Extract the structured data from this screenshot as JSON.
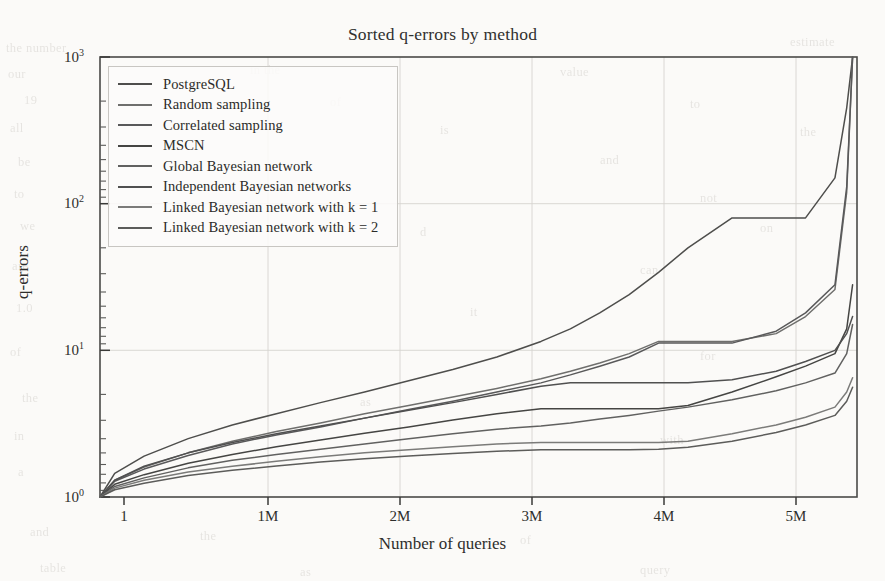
{
  "figure": {
    "title": "Sorted q-errors by method",
    "title_plain": "Sorted q-errors by method"
  },
  "axes": {
    "x_title": "Number of queries",
    "y_title": "q-errors",
    "x_ticks": [
      "1",
      "1M",
      "2M",
      "3M",
      "4M",
      "5M"
    ],
    "y_ticks": [
      "10",
      "10",
      "10",
      "10"
    ],
    "y_tick_exponents": [
      "0",
      "1",
      "2",
      "3"
    ]
  },
  "legend": {
    "items": [
      {
        "label": "PostgreSQL",
        "color": "#4e4e4c"
      },
      {
        "label": "Random sampling",
        "color": "#6f6f6d"
      },
      {
        "label": "Correlated sampling",
        "color": "#59595a"
      },
      {
        "label": "MSCN",
        "color": "#454543"
      },
      {
        "label": "Global Bayesian network",
        "color": "#616160"
      },
      {
        "label": "Independent Bayesian networks",
        "color": "#505050"
      },
      {
        "label": "Linked Bayesian network with k = 1",
        "color": "#7b7b79"
      },
      {
        "label": "Linked Bayesian network with k = 2",
        "color": "#5c5c5a"
      }
    ]
  },
  "chart_data": {
    "type": "line",
    "title": "Sorted q-errors by method",
    "xlabel": "Number of queries",
    "ylabel": "q-errors",
    "xlim": [
      0,
      5150000
    ],
    "ylim": [
      1,
      1000
    ],
    "yscale": "log",
    "xscale": "linear",
    "grid": true,
    "legend_position": "upper-left",
    "x_tick_values": [
      1,
      1000000,
      2000000,
      3000000,
      4000000,
      5000000
    ],
    "x_tick_labels": [
      "1",
      "1M",
      "2M",
      "3M",
      "4M",
      "5M"
    ],
    "y_tick_values": [
      1,
      10,
      100,
      1000
    ],
    "y_tick_labels": [
      "10^0",
      "10^1",
      "10^2",
      "10^3"
    ],
    "x": [
      1,
      100000,
      300000,
      600000,
      900000,
      1200000,
      1500000,
      1800000,
      2100000,
      2400000,
      2700000,
      3000000,
      3200000,
      3400000,
      3600000,
      3800000,
      4000000,
      4300000,
      4600000,
      4800000,
      5000000,
      5080000,
      5120000
    ],
    "series": [
      {
        "name": "PostgreSQL",
        "color": "#4e4e4c",
        "values": [
          1.0,
          1.45,
          1.9,
          2.5,
          3.1,
          3.7,
          4.4,
          5.2,
          6.2,
          7.4,
          9.0,
          11.5,
          14.0,
          18.0,
          24.0,
          34.0,
          50.0,
          80.0,
          80.0,
          80.0,
          150.0,
          450.0,
          1000.0
        ]
      },
      {
        "name": "Random sampling",
        "color": "#6f6f6d",
        "values": [
          1.0,
          1.3,
          1.6,
          2.0,
          2.4,
          2.8,
          3.2,
          3.7,
          4.2,
          4.8,
          5.5,
          6.4,
          7.2,
          8.2,
          9.5,
          11.5,
          11.5,
          11.5,
          13.0,
          17.0,
          26.0,
          120.0,
          1000.0
        ]
      },
      {
        "name": "Correlated sampling",
        "color": "#59595a",
        "values": [
          1.0,
          1.28,
          1.55,
          1.92,
          2.3,
          2.65,
          3.0,
          3.45,
          3.95,
          4.5,
          5.2,
          6.0,
          6.8,
          7.8,
          9.0,
          11.2,
          11.2,
          11.2,
          13.5,
          18.0,
          28.0,
          130.0,
          1000.0
        ]
      },
      {
        "name": "MSCN",
        "color": "#454543",
        "values": [
          1.0,
          1.22,
          1.42,
          1.7,
          1.95,
          2.2,
          2.45,
          2.72,
          3.0,
          3.35,
          3.7,
          4.0,
          4.0,
          4.0,
          4.0,
          4.0,
          4.2,
          5.2,
          6.6,
          7.8,
          9.5,
          14.0,
          28.0
        ]
      },
      {
        "name": "Global Bayesian network",
        "color": "#616160",
        "values": [
          1.0,
          1.18,
          1.35,
          1.58,
          1.78,
          1.95,
          2.12,
          2.3,
          2.5,
          2.7,
          2.9,
          3.05,
          3.2,
          3.4,
          3.6,
          3.85,
          4.1,
          4.6,
          5.3,
          6.0,
          7.0,
          9.5,
          15.0
        ]
      },
      {
        "name": "Independent Bayesian networks",
        "color": "#505050",
        "values": [
          1.0,
          1.3,
          1.62,
          2.0,
          2.35,
          2.7,
          3.05,
          3.45,
          3.9,
          4.4,
          5.0,
          5.7,
          6.0,
          6.0,
          6.0,
          6.0,
          6.0,
          6.3,
          7.2,
          8.4,
          10.0,
          13.0,
          17.0
        ]
      },
      {
        "name": "Linked Bayesian network with k = 1",
        "color": "#7b7b79",
        "values": [
          1.0,
          1.15,
          1.3,
          1.48,
          1.62,
          1.75,
          1.88,
          2.0,
          2.1,
          2.2,
          2.3,
          2.35,
          2.35,
          2.35,
          2.35,
          2.35,
          2.4,
          2.7,
          3.1,
          3.5,
          4.1,
          5.2,
          6.5
        ]
      },
      {
        "name": "Linked Bayesian network with k = 2",
        "color": "#5c5c5a",
        "values": [
          1.0,
          1.12,
          1.24,
          1.4,
          1.52,
          1.63,
          1.73,
          1.82,
          1.9,
          1.98,
          2.05,
          2.1,
          2.1,
          2.1,
          2.1,
          2.12,
          2.18,
          2.4,
          2.75,
          3.1,
          3.6,
          4.5,
          5.6
        ]
      }
    ],
    "annotations": [
      {
        "text": "PostgreSQL plateaus near q-error 80 between 3.8M and 4.6M queries"
      },
      {
        "text": "All methods spike steeply toward the right edge near 5.1M queries"
      }
    ]
  },
  "bleed_through": {
    "lines": [
      {
        "x": 6,
        "y": 36,
        "text": "the number"
      },
      {
        "x": 790,
        "y": 30,
        "text": "estimate"
      },
      {
        "x": 8,
        "y": 62,
        "text": "our"
      },
      {
        "x": 250,
        "y": 58,
        "text": "in the"
      },
      {
        "x": 560,
        "y": 60,
        "text": "value"
      },
      {
        "x": 24,
        "y": 88,
        "text": "19"
      },
      {
        "x": 330,
        "y": 90,
        "text": "of"
      },
      {
        "x": 690,
        "y": 92,
        "text": "to"
      },
      {
        "x": 10,
        "y": 116,
        "text": "all"
      },
      {
        "x": 440,
        "y": 118,
        "text": "is"
      },
      {
        "x": 800,
        "y": 120,
        "text": "the"
      },
      {
        "x": 18,
        "y": 150,
        "text": "be"
      },
      {
        "x": 600,
        "y": 148,
        "text": "and"
      },
      {
        "x": 14,
        "y": 182,
        "text": "to"
      },
      {
        "x": 700,
        "y": 186,
        "text": "not"
      },
      {
        "x": 20,
        "y": 214,
        "text": "we"
      },
      {
        "x": 420,
        "y": 220,
        "text": "d"
      },
      {
        "x": 760,
        "y": 216,
        "text": "on"
      },
      {
        "x": 12,
        "y": 254,
        "text": "are"
      },
      {
        "x": 640,
        "y": 258,
        "text": "can"
      },
      {
        "x": 16,
        "y": 296,
        "text": "1.0"
      },
      {
        "x": 470,
        "y": 300,
        "text": "it"
      },
      {
        "x": 10,
        "y": 340,
        "text": "of"
      },
      {
        "x": 700,
        "y": 344,
        "text": "for"
      },
      {
        "x": 22,
        "y": 386,
        "text": "the"
      },
      {
        "x": 360,
        "y": 390,
        "text": "as"
      },
      {
        "x": 14,
        "y": 424,
        "text": "in"
      },
      {
        "x": 660,
        "y": 428,
        "text": "with"
      },
      {
        "x": 18,
        "y": 460,
        "text": "a"
      },
      {
        "x": 30,
        "y": 520,
        "text": "and"
      },
      {
        "x": 200,
        "y": 524,
        "text": "the"
      },
      {
        "x": 520,
        "y": 528,
        "text": "of"
      },
      {
        "x": 40,
        "y": 556,
        "text": "table"
      },
      {
        "x": 300,
        "y": 560,
        "text": "as"
      },
      {
        "x": 640,
        "y": 558,
        "text": "query"
      }
    ]
  }
}
